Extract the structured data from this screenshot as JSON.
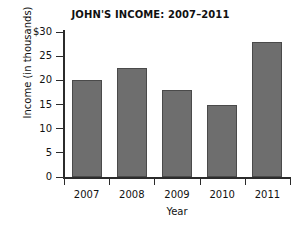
{
  "chart_data": {
    "type": "bar",
    "title": "JOHN'S INCOME: 2007–2011",
    "xlabel": "Year",
    "ylabel": "Income (in thousands)",
    "categories": [
      "2007",
      "2008",
      "2009",
      "2010",
      "2011"
    ],
    "values": [
      20,
      22.5,
      18,
      15,
      28
    ],
    "ylim": [
      0,
      30
    ],
    "ytick_values": [
      30,
      25,
      20,
      15,
      10,
      5,
      0
    ],
    "ytick_labels": [
      "$30",
      "25",
      "20",
      "15",
      "10",
      "5",
      "0"
    ],
    "grid": false,
    "legend": false,
    "bar_color": "#6e6e6e",
    "bar_edge_color": "#4a4a4a",
    "axis_color": "#2b2b2b",
    "background_color": "#ffffff"
  }
}
